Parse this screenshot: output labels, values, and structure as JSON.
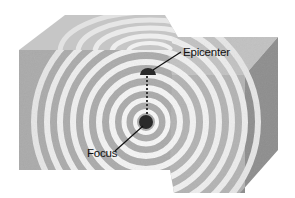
{
  "diagram": {
    "type": "earthquake-cross-section",
    "labels": {
      "epicenter": "Epicenter",
      "focus": "Focus"
    },
    "colors": {
      "front_face": "#a9a9a9",
      "top_face": "#c4c4c4",
      "side_face": "#8f8f8f",
      "wave_ring": "#eeeeee",
      "marker": "#2a2a2a",
      "leader_line": "#111111",
      "background": "#ffffff"
    }
  }
}
